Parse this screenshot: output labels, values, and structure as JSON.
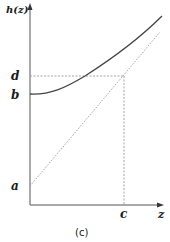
{
  "figure": {
    "caption": "(c)",
    "y_axis_label": "h(z)",
    "x_axis_label": "z",
    "points": {
      "a": "a",
      "b": "b",
      "c": "c",
      "d": "d"
    },
    "colors": {
      "axis": "#555555",
      "curve": "#444444",
      "dotted": "#999999",
      "text": "#1a1a1a"
    }
  },
  "elements": [
    {
      "name": "curve h(z)",
      "description": "convex increasing curve starting at (0, b)"
    },
    {
      "name": "dotted line",
      "description": "diagonal dotted line starting at (0, a)"
    },
    {
      "name": "dotted guide",
      "description": "horizontal dotted from d to point above c, vertical dotted down to c"
    }
  ]
}
